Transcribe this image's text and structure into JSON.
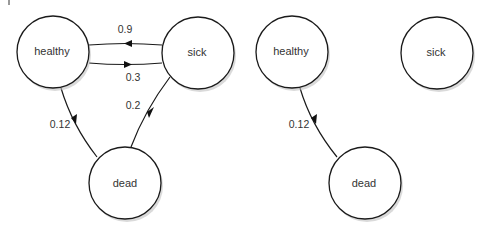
{
  "diagrams": [
    {
      "name": "full-markov-chain",
      "nodes": [
        {
          "id": "healthy",
          "label": "healthy"
        },
        {
          "id": "sick",
          "label": "sick"
        },
        {
          "id": "dead",
          "label": "dead"
        }
      ],
      "edges": [
        {
          "from": "sick",
          "to": "healthy",
          "label": "0.9"
        },
        {
          "from": "healthy",
          "to": "sick",
          "label": "0.3"
        },
        {
          "from": "sick",
          "to": "dead",
          "label": "0.2"
        },
        {
          "from": "healthy",
          "to": "dead",
          "label": "0.12"
        }
      ]
    },
    {
      "name": "reduced-markov-chain",
      "nodes": [
        {
          "id": "healthy",
          "label": "healthy"
        },
        {
          "id": "sick",
          "label": "sick"
        },
        {
          "id": "dead",
          "label": "dead"
        }
      ],
      "edges": [
        {
          "from": "healthy",
          "to": "dead",
          "label": "0.12"
        }
      ]
    }
  ]
}
